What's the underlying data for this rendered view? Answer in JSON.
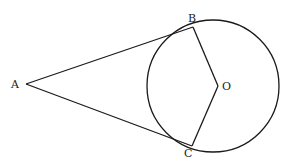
{
  "diagram": {
    "type": "geometry",
    "stroke_color": "#1a1a1a",
    "circle": {
      "cx": 213,
      "cy": 86,
      "r": 66
    },
    "points": {
      "A": {
        "x": 26,
        "y": 84,
        "label": "A"
      },
      "B": {
        "x": 193,
        "y": 27,
        "label": "B"
      },
      "C": {
        "x": 192,
        "y": 146,
        "label": "C"
      },
      "O": {
        "x": 218,
        "y": 86,
        "label": "O"
      }
    },
    "segments": [
      [
        "A",
        "B"
      ],
      [
        "A",
        "C"
      ],
      [
        "B",
        "O"
      ],
      [
        "C",
        "O"
      ]
    ]
  }
}
